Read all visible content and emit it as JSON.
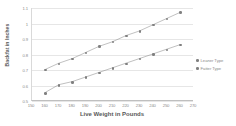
{
  "chart_data": {
    "type": "scatter",
    "title": "",
    "xlabel": "Live Weight in Pounds",
    "ylabel": "Backfat in Inches",
    "xlim": [
      150,
      270
    ],
    "ylim": [
      0.5,
      1.1
    ],
    "xticks": [
      150,
      160,
      170,
      180,
      190,
      200,
      210,
      220,
      230,
      240,
      250,
      260,
      270
    ],
    "yticks": [
      0.5,
      0.6,
      0.7,
      0.8,
      0.9,
      1,
      1.1
    ],
    "ytick_labels": [
      "0.5",
      "0.6",
      "0.7",
      "0.8",
      "0.9",
      "1",
      "1.1"
    ],
    "xtick_labels": [
      "150",
      "160",
      "170",
      "180",
      "190",
      "200",
      "210",
      "220",
      "230",
      "240",
      "250",
      "260",
      "270"
    ],
    "grid": true,
    "legend_position": "right",
    "x": [
      160,
      170,
      180,
      190,
      200,
      210,
      220,
      230,
      240,
      250,
      260
    ],
    "series": [
      {
        "name": "Leaner Type",
        "color": "#808080",
        "values": [
          0.7,
          0.74,
          0.77,
          0.81,
          0.85,
          0.88,
          0.92,
          0.95,
          0.99,
          1.03,
          1.07
        ]
      },
      {
        "name": "Fatter Type",
        "color": "#7f7f7f",
        "values": [
          0.55,
          0.6,
          0.62,
          0.65,
          0.68,
          0.71,
          0.74,
          0.77,
          0.8,
          0.83,
          0.86
        ]
      }
    ]
  },
  "legend": {
    "items": [
      {
        "label": "Leaner Type"
      },
      {
        "label": "Fatter Type"
      }
    ]
  },
  "axes": {
    "y_title": "Backfat in Inches",
    "x_title": "Live Weight in Pounds"
  },
  "colors": {
    "series_1": "#808080",
    "series_2": "#7f7f7f",
    "gridline": "#e6e6e6",
    "axis": "#bfbfbf",
    "tick_text": "#8c8c8c",
    "title_text": "#595959",
    "background": "#ffffff"
  }
}
